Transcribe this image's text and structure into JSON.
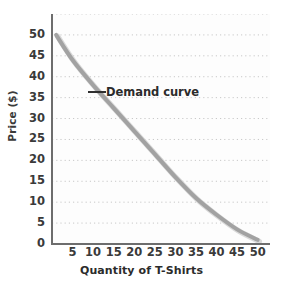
{
  "chart_data": {
    "type": "line",
    "title": "",
    "subtitle": "",
    "xlabel": "Quantity of T-Shirts",
    "ylabel": "Price ($)",
    "xlim": [
      0,
      53
    ],
    "ylim": [
      0,
      55
    ],
    "grid": true,
    "grid_style": "dotted-horizontal",
    "legend_position": "none",
    "x_ticks": [
      5,
      10,
      15,
      20,
      25,
      30,
      35,
      40,
      45,
      50
    ],
    "y_ticks": [
      0,
      5,
      10,
      15,
      20,
      25,
      30,
      35,
      40,
      45,
      50
    ],
    "x_tick_labels": [
      "5",
      "10",
      "15",
      "20",
      "25",
      "30",
      "35",
      "40",
      "45",
      "50"
    ],
    "y_tick_labels": [
      "0",
      "5",
      "10",
      "15",
      "20",
      "25",
      "30",
      "35",
      "40",
      "45",
      "50"
    ],
    "series": [
      {
        "name": "Demand curve",
        "color": "#a2a2a2",
        "line_width": 4,
        "x": [
          1,
          5,
          10,
          15,
          20,
          25,
          30,
          35,
          40,
          45,
          50
        ],
        "y": [
          50,
          44,
          38,
          32.5,
          27,
          21.5,
          16,
          11,
          7,
          3.5,
          1
        ]
      }
    ],
    "annotations": [
      {
        "text": "Demand curve",
        "x": 11,
        "y": 37,
        "leader": true
      }
    ]
  },
  "axes": {
    "y_title": "Price ($)",
    "x_title": "Quantity of T-Shirts"
  },
  "colors": {
    "curve": "#a2a2a2",
    "axis": "#6d6d6d",
    "grid": "#c8c8c8",
    "text": "#3a3a3a",
    "plot_background": "#fdfdfd"
  }
}
